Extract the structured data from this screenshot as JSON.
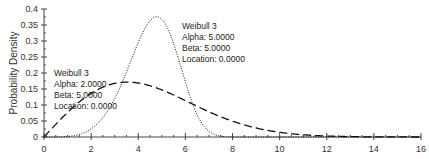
{
  "chart_data": {
    "type": "line",
    "title": "",
    "xlabel": "",
    "ylabel": "Probability Density",
    "xlim": [
      0,
      16
    ],
    "ylim": [
      0,
      0.4
    ],
    "x_ticks": [
      "0",
      "2",
      "4",
      "6",
      "8",
      "10",
      "12",
      "14",
      "16"
    ],
    "y_ticks": [
      "0",
      "0.05",
      "0.1",
      "0.15",
      "0.2",
      "0.25",
      "0.3",
      "0.35",
      "0.4"
    ],
    "grid": false,
    "legend": "none (inline annotations)",
    "series": [
      {
        "name": "Weibull 3 (Alpha 2, Beta 5, Location 0)",
        "style": "dashed",
        "distribution": {
          "family": "Weibull",
          "alpha": 2.0,
          "beta": 5.0,
          "location": 0.0
        },
        "x": [
          0,
          1,
          2,
          3,
          3.54,
          4,
          5,
          6,
          7,
          8,
          9,
          10,
          11,
          12,
          13,
          14,
          15,
          16
        ],
        "values": [
          0,
          0.077,
          0.136,
          0.167,
          0.172,
          0.169,
          0.147,
          0.114,
          0.079,
          0.05,
          0.028,
          0.015,
          0.007,
          0.003,
          0.001,
          0.0006,
          0.0002,
          0.0001
        ]
      },
      {
        "name": "Weibull 3 (Alpha 5, Beta 5, Location 0)",
        "style": "dotted",
        "distribution": {
          "family": "Weibull",
          "alpha": 5.0,
          "beta": 5.0,
          "location": 0.0
        },
        "x": [
          0,
          1,
          2,
          3,
          4,
          4.78,
          5,
          6,
          7,
          7.5,
          8
        ],
        "values": [
          0,
          0.0003,
          0.005,
          0.026,
          0.082,
          0.376,
          0.368,
          0.204,
          0.032,
          0.005,
          0.0003
        ]
      }
    ],
    "annotations": [
      {
        "lines": [
          "Weibull 3",
          "Alpha: 2.0000",
          "Beta: 5.0000",
          "Location: 0.0000"
        ]
      },
      {
        "lines": [
          "Weibull 3",
          "Alpha: 5.0000",
          "Beta: 5.0000",
          "Location: 0.0000"
        ]
      }
    ]
  }
}
